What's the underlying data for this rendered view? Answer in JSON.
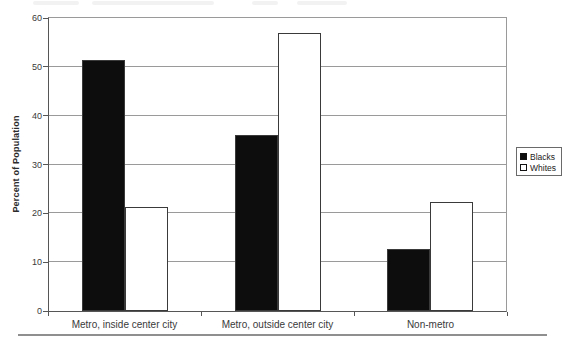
{
  "chart_data": {
    "type": "bar",
    "categories": [
      "Metro, inside center city",
      "Metro, outside center city",
      "Non-metro"
    ],
    "series": [
      {
        "name": "Blacks",
        "color": "#0d0d0d",
        "values": [
          51.5,
          36.0,
          12.6
        ]
      },
      {
        "name": "Whites",
        "color": "#ffffff",
        "values": [
          21.2,
          57.0,
          22.3
        ]
      }
    ],
    "ylabel": "Percent of Population",
    "ylim": [
      0,
      60
    ],
    "yticks": [
      0,
      10,
      20,
      30,
      40,
      50,
      60
    ],
    "grid": "horizontal",
    "legend_position": "right"
  }
}
